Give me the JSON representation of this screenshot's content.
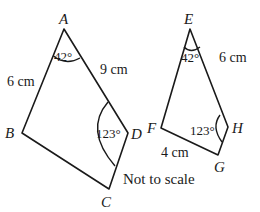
{
  "diagram": {
    "note": "Not to scale",
    "shape1": {
      "vertices": [
        "A",
        "B",
        "C",
        "D"
      ],
      "angle_A": "42°",
      "angle_D": "123°",
      "side_AB": "6 cm",
      "side_AD": "9 cm"
    },
    "shape2": {
      "vertices": [
        "E",
        "F",
        "G",
        "H"
      ],
      "angle_E": "42°",
      "angle_H": "123°",
      "side_EH": "6 cm",
      "side_FG": "4 cm"
    },
    "colors": {
      "stroke": "#1a1a1a",
      "background": "#ffffff"
    }
  }
}
